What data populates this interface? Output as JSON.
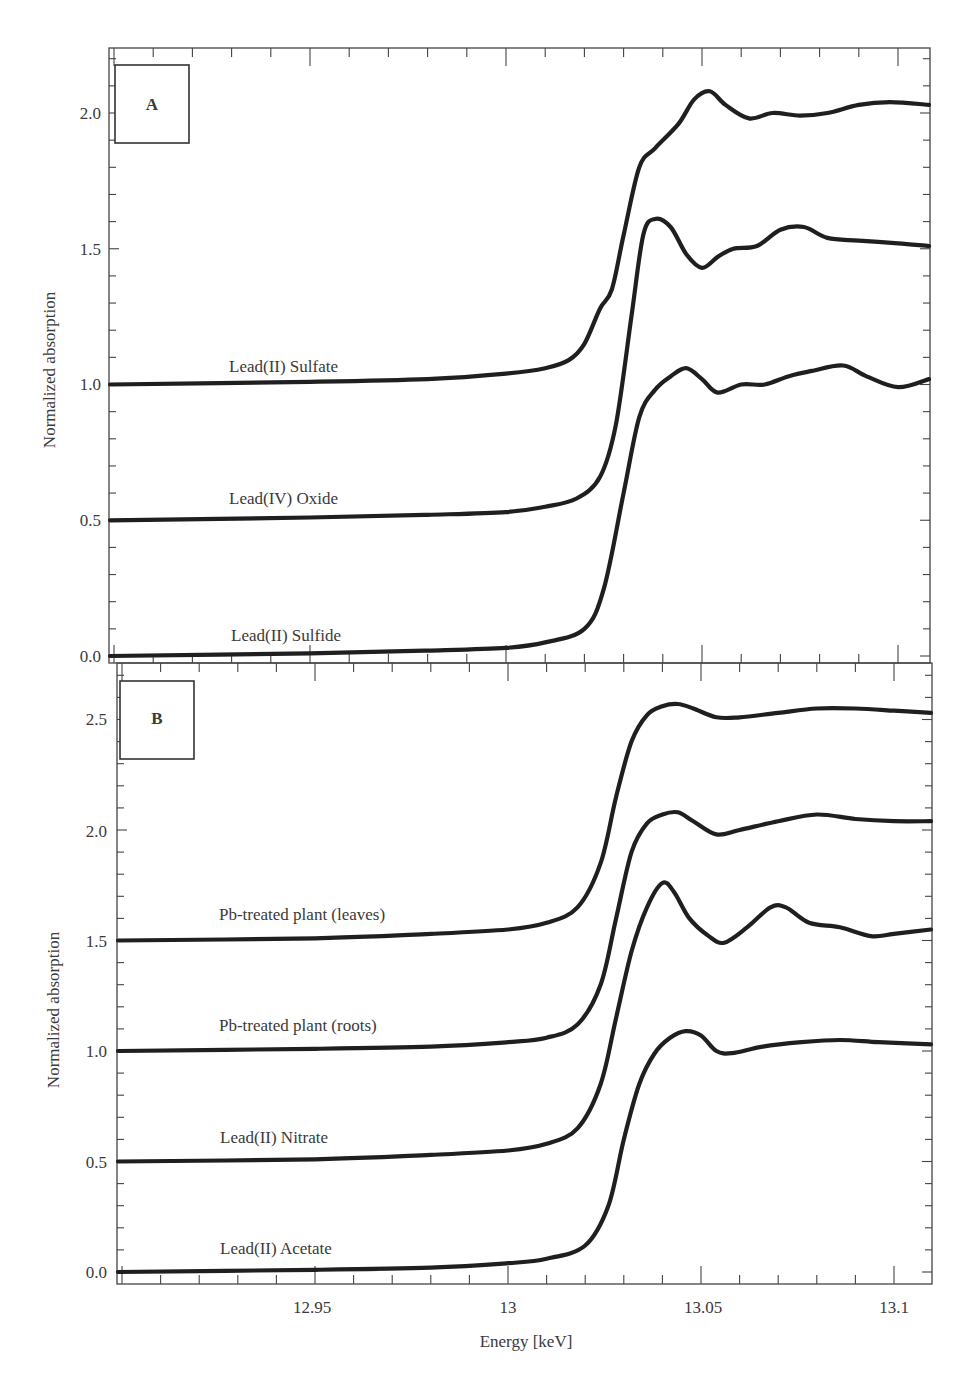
{
  "figure": {
    "xlabel": "Energy [keV]",
    "shared_x_ticks": [
      "12.95",
      "13",
      "13.05",
      "13.1"
    ]
  },
  "panels": [
    {
      "letter": "A",
      "ylabel": "Normalized absorption",
      "y_ticks": [
        "0.0",
        "0.5",
        "1.0",
        "1.5",
        "2.0"
      ],
      "labels": [
        "Lead(II) Sulfate",
        "Lead(IV) Oxide",
        "Lead(II) Sulfide"
      ]
    },
    {
      "letter": "B",
      "ylabel": "Normalized absorption",
      "y_ticks": [
        "0.0",
        "0.5",
        "1.0",
        "1.5",
        "2.0",
        "2.5"
      ],
      "labels": [
        "Pb-treated plant (leaves)",
        "Pb-treated plant (roots)",
        "Lead(II) Nitrate",
        "Lead(II) Acetate"
      ]
    }
  ],
  "chart_data": [
    {
      "type": "line",
      "panel": "A",
      "title": "",
      "xlabel": "Energy [keV]",
      "ylabel": "Normalized absorption",
      "xlim": [
        12.9,
        13.108
      ],
      "ylim": [
        -0.02,
        2.22
      ],
      "x_ticks": [
        12.95,
        13.0,
        13.05,
        13.1
      ],
      "y_ticks": [
        0.0,
        0.5,
        1.0,
        1.5,
        2.0
      ],
      "grid": false,
      "legend": "inline labels",
      "series": [
        {
          "name": "Lead(II) Sulfate",
          "offset": 1.0,
          "x": [
            12.9,
            12.95,
            12.98,
            13.0,
            13.01,
            13.016,
            13.02,
            13.024,
            13.027,
            13.03,
            13.034,
            13.038,
            13.044,
            13.048,
            13.052,
            13.056,
            13.062,
            13.068,
            13.075,
            13.082,
            13.09,
            13.098,
            13.108
          ],
          "values": [
            1.0,
            1.01,
            1.02,
            1.04,
            1.06,
            1.09,
            1.15,
            1.28,
            1.35,
            1.55,
            1.8,
            1.87,
            1.96,
            2.05,
            2.08,
            2.03,
            1.98,
            2.0,
            1.99,
            2.0,
            2.03,
            2.04,
            2.03
          ]
        },
        {
          "name": "Lead(IV) Oxide",
          "offset": 0.5,
          "x": [
            12.9,
            12.95,
            12.98,
            13.0,
            13.01,
            13.018,
            13.024,
            13.028,
            13.032,
            13.035,
            13.038,
            13.042,
            13.046,
            13.05,
            13.054,
            13.058,
            13.064,
            13.07,
            13.076,
            13.082,
            13.09,
            13.1,
            13.108
          ],
          "values": [
            0.5,
            0.51,
            0.52,
            0.53,
            0.55,
            0.58,
            0.66,
            0.85,
            1.25,
            1.55,
            1.61,
            1.58,
            1.48,
            1.43,
            1.47,
            1.5,
            1.51,
            1.57,
            1.58,
            1.54,
            1.53,
            1.52,
            1.51
          ]
        },
        {
          "name": "Lead(II) Sulfide",
          "offset": 0.0,
          "x": [
            12.9,
            12.95,
            12.98,
            13.0,
            13.01,
            13.02,
            13.025,
            13.03,
            13.034,
            13.038,
            13.042,
            13.046,
            13.05,
            13.054,
            13.06,
            13.066,
            13.072,
            13.078,
            13.086,
            13.092,
            13.1,
            13.108
          ],
          "values": [
            0.0,
            0.01,
            0.02,
            0.03,
            0.05,
            0.1,
            0.25,
            0.6,
            0.88,
            0.98,
            1.03,
            1.06,
            1.02,
            0.97,
            1.0,
            1.0,
            1.03,
            1.05,
            1.07,
            1.03,
            0.99,
            1.02
          ]
        }
      ]
    },
    {
      "type": "line",
      "panel": "B",
      "title": "",
      "xlabel": "Energy [keV]",
      "ylabel": "Normalized absorption",
      "xlim": [
        12.9,
        13.108
      ],
      "ylim": [
        -0.03,
        2.75
      ],
      "x_ticks": [
        12.95,
        13.0,
        13.05,
        13.1
      ],
      "y_ticks": [
        0.0,
        0.5,
        1.0,
        1.5,
        2.0,
        2.5
      ],
      "grid": false,
      "legend": "inline labels",
      "series": [
        {
          "name": "Pb-treated plant (leaves)",
          "offset": 1.5,
          "x": [
            12.9,
            12.95,
            12.98,
            13.0,
            13.01,
            13.018,
            13.024,
            13.028,
            13.032,
            13.036,
            13.04,
            13.044,
            13.048,
            13.054,
            13.06,
            13.07,
            13.08,
            13.09,
            13.1,
            13.108
          ],
          "values": [
            1.5,
            1.51,
            1.53,
            1.55,
            1.58,
            1.65,
            1.85,
            2.15,
            2.4,
            2.52,
            2.56,
            2.57,
            2.55,
            2.51,
            2.51,
            2.53,
            2.55,
            2.55,
            2.54,
            2.53
          ]
        },
        {
          "name": "Pb-treated plant (roots)",
          "offset": 1.0,
          "x": [
            12.9,
            12.95,
            12.98,
            13.0,
            13.01,
            13.018,
            13.024,
            13.028,
            13.032,
            13.036,
            13.04,
            13.044,
            13.048,
            13.054,
            13.06,
            13.07,
            13.08,
            13.09,
            13.1,
            13.108
          ],
          "values": [
            1.0,
            1.01,
            1.02,
            1.04,
            1.06,
            1.12,
            1.3,
            1.6,
            1.9,
            2.03,
            2.07,
            2.08,
            2.04,
            1.98,
            2.0,
            2.04,
            2.07,
            2.05,
            2.04,
            2.04
          ]
        },
        {
          "name": "Lead(II) Nitrate",
          "offset": 0.5,
          "x": [
            12.9,
            12.95,
            12.98,
            13.0,
            13.01,
            13.018,
            13.024,
            13.028,
            13.032,
            13.036,
            13.04,
            13.043,
            13.047,
            13.052,
            13.056,
            13.062,
            13.068,
            13.072,
            13.078,
            13.086,
            13.094,
            13.1,
            13.108
          ],
          "values": [
            0.5,
            0.51,
            0.53,
            0.55,
            0.58,
            0.65,
            0.85,
            1.15,
            1.45,
            1.65,
            1.76,
            1.72,
            1.6,
            1.52,
            1.49,
            1.56,
            1.65,
            1.65,
            1.58,
            1.56,
            1.52,
            1.53,
            1.55
          ]
        },
        {
          "name": "Lead(II) Acetate",
          "offset": 0.0,
          "x": [
            12.9,
            12.95,
            12.98,
            13.0,
            13.01,
            13.02,
            13.026,
            13.03,
            13.034,
            13.038,
            13.042,
            13.046,
            13.05,
            13.054,
            13.058,
            13.066,
            13.076,
            13.086,
            13.096,
            13.108
          ],
          "values": [
            0.0,
            0.01,
            0.02,
            0.04,
            0.06,
            0.12,
            0.3,
            0.6,
            0.85,
            0.99,
            1.06,
            1.09,
            1.07,
            1.0,
            0.99,
            1.02,
            1.04,
            1.05,
            1.04,
            1.03
          ]
        }
      ]
    }
  ]
}
